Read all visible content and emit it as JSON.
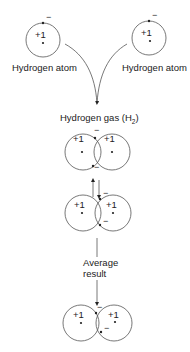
{
  "diagram": {
    "atoms": [
      {
        "label": "Hydrogen atom",
        "nucleus_charge": "+1",
        "electron_charge": "−"
      },
      {
        "label": "Hydrogen atom",
        "nucleus_charge": "+1",
        "electron_charge": "−"
      }
    ],
    "molecule_label": "Hydrogen gas (H",
    "molecule_subscript": "2",
    "molecule_label_close": ")",
    "average_label_line1": "Average",
    "average_label_line2": "result",
    "charges": {
      "nucleus": "+1",
      "electron": "−"
    },
    "stages": [
      "Two separate hydrogen atoms",
      "H2 molecule with electrons shared between nuclei",
      "Alternate electron configuration (equilibrium arrows)",
      "Average result"
    ]
  }
}
